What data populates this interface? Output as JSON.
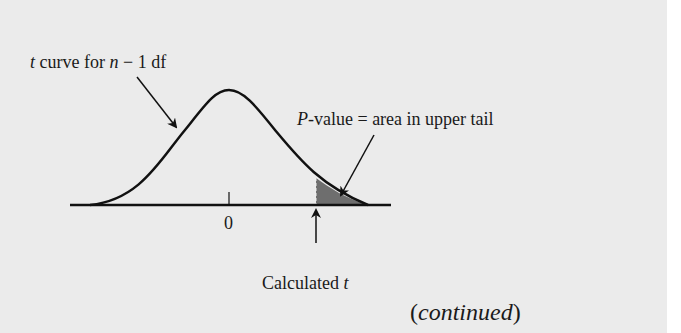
{
  "diagram": {
    "curve_label": {
      "var": "t",
      "text_a": " curve for ",
      "var_n": "n",
      "text_b": " − 1 df"
    },
    "pvalue_label": {
      "var": "P",
      "text": "-value = area in upper tail"
    },
    "axis_tick_label": "0",
    "calculated_label": {
      "text": "Calculated ",
      "var": "t"
    },
    "continued_label": {
      "open": "(",
      "text": "continued",
      "close": ")"
    },
    "colors": {
      "background": "#ebebeb",
      "curve": "#111111",
      "shaded_tail": "#6e6e6e"
    }
  }
}
